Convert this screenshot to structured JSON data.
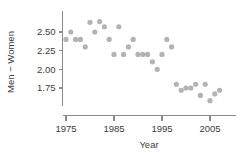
{
  "chart_data": {
    "type": "scatter",
    "title": "",
    "subtitle": "",
    "xlabel": "Year",
    "ylabel": "Men − Women",
    "xlim": [
      1973.5,
      2008.5
    ],
    "ylim": [
      1.58,
      2.72
    ],
    "xticks": [
      1975,
      1985,
      1995,
      2005
    ],
    "xtick_labels": [
      "1975",
      "1985",
      "1995",
      "2005"
    ],
    "yticks": [
      1.75,
      2.0,
      2.25,
      2.5
    ],
    "ytick_labels": [
      "1.75",
      "2.00",
      "2.25",
      "2.50"
    ],
    "grid": false,
    "legend": null,
    "marker": "filled-circle",
    "marker_color": "#b3b3b3",
    "axis_color": "#8c8c8c",
    "series": [
      {
        "name": "Men − Women winning time difference",
        "x": [
          1975,
          1976,
          1977,
          1978,
          1979,
          1980,
          1981,
          1982,
          1983,
          1984,
          1985,
          1986,
          1987,
          1988,
          1989,
          1990,
          1991,
          1992,
          1993,
          1994,
          1995,
          1996,
          1997,
          1998,
          1999,
          2000,
          2001,
          2002,
          2003,
          2004,
          2005,
          2006,
          2007
        ],
        "y": [
          2.4,
          2.5,
          2.4,
          2.4,
          2.3,
          2.63,
          2.5,
          2.64,
          2.57,
          2.4,
          2.2,
          2.57,
          2.2,
          2.3,
          2.4,
          2.2,
          2.2,
          2.2,
          2.1,
          2.0,
          2.2,
          2.4,
          2.3,
          1.8,
          1.72,
          1.75,
          1.75,
          1.8,
          1.65,
          1.8,
          1.58,
          1.67,
          1.72
        ]
      }
    ]
  },
  "figure": {
    "background": "#ffffff",
    "point_radius_px": 2.6
  }
}
